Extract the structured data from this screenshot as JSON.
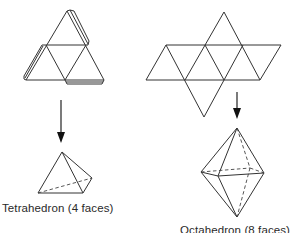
{
  "figures": [
    {
      "id": "tetrahedron",
      "net_label": "Tetrahedron net with glue tabs",
      "solid_label": "Tetrahedron (4 faces)",
      "faces": 4
    },
    {
      "id": "octahedron",
      "net_label": "Octahedron net",
      "solid_label": "Octahedron (8 faces)",
      "faces": 8
    }
  ],
  "colors": {
    "line": "#333333",
    "background": "#ffffff",
    "text": "#2a2a2a"
  }
}
